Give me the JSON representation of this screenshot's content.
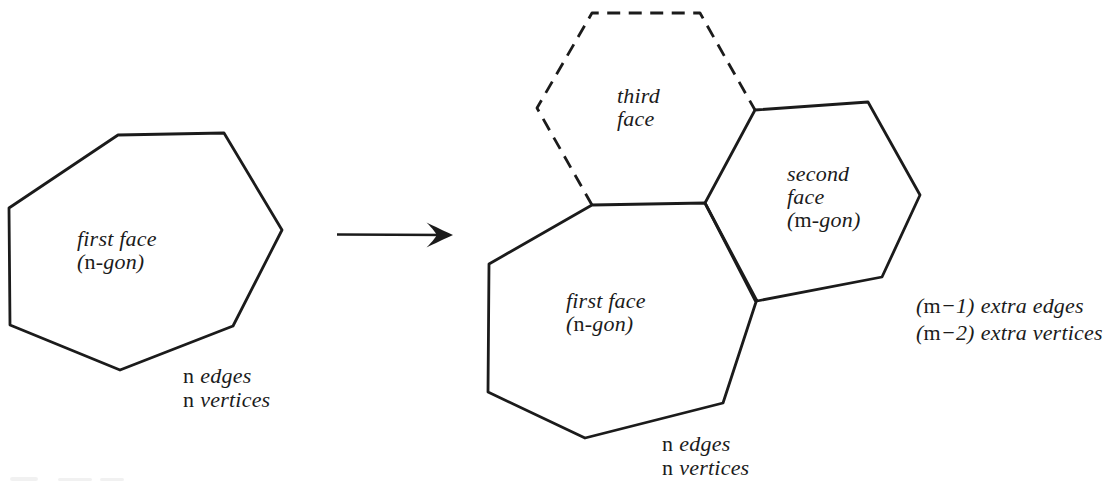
{
  "colors": {
    "ink": "#1b1b1b",
    "paper": "#ffffff"
  },
  "left_figure": {
    "face_label": {
      "line1": "first face",
      "paren_open": "(",
      "var": "n",
      "paren_rest": "-gon)"
    },
    "counts": {
      "var": "n",
      "line1_word": "edges",
      "line2_word": "vertices"
    }
  },
  "right_figure": {
    "first_face_label": {
      "line1": "first face",
      "paren_open": "(",
      "var": "n",
      "paren_rest": "-gon)"
    },
    "second_face_label": {
      "line1": "second",
      "line2": "face",
      "paren_open": "(",
      "var": "m",
      "paren_rest": "-gon)"
    },
    "third_face_label": {
      "line1": "third",
      "line2": "face"
    },
    "counts": {
      "var": "n",
      "line1_word": "edges",
      "line2_word": "vertices"
    },
    "extra_counts": {
      "line1": {
        "open": "(",
        "var": "m",
        "close": "−1)",
        "words": "extra edges"
      },
      "line2": {
        "open": "(",
        "var": "m",
        "close": "−2)",
        "words": "extra vertices"
      }
    }
  }
}
